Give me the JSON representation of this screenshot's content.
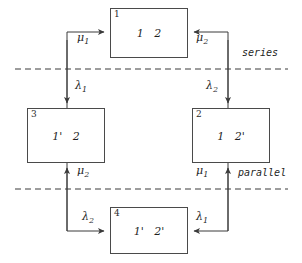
{
  "diagram": {
    "background_color": "#ffffff",
    "stroke_color": "#4a4a4a",
    "text_color": "#1f1f1f",
    "nodes": [
      {
        "key": "node-1",
        "id": "1",
        "contents": "1   2",
        "x": 110,
        "y": 8,
        "w": 78,
        "h": 50
      },
      {
        "key": "node-2",
        "id": "2",
        "contents": "1   2'",
        "x": 192,
        "y": 108,
        "w": 78,
        "h": 55
      },
      {
        "key": "node-3",
        "id": "3",
        "contents": "1'   2",
        "x": 27,
        "y": 108,
        "w": 78,
        "h": 55
      },
      {
        "key": "node-4",
        "id": "4",
        "contents": "1'   2'",
        "x": 110,
        "y": 207,
        "w": 78,
        "h": 47
      }
    ],
    "edge_labels": [
      {
        "key": "mu-1-top-left",
        "symbol": "μ",
        "sub": "1",
        "x": 77,
        "y": 32
      },
      {
        "key": "mu-2-top-right",
        "symbol": "μ",
        "sub": "2",
        "x": 196,
        "y": 32
      },
      {
        "key": "lambda-1-left",
        "symbol": "λ",
        "sub": "1",
        "x": 75,
        "y": 80
      },
      {
        "key": "lambda-2-right",
        "symbol": "λ",
        "sub": "2",
        "x": 206,
        "y": 80
      },
      {
        "key": "mu-2-bottom-left",
        "symbol": "μ",
        "sub": "2",
        "x": 77,
        "y": 165
      },
      {
        "key": "mu-1-bottom-right",
        "symbol": "μ",
        "sub": "1",
        "x": 196,
        "y": 165
      },
      {
        "key": "lambda-2-bottom",
        "symbol": "λ",
        "sub": "2",
        "x": 82,
        "y": 211
      },
      {
        "key": "lambda-1-bottom",
        "symbol": "λ",
        "sub": "1",
        "x": 196,
        "y": 211
      }
    ],
    "region_labels": [
      {
        "key": "series-label",
        "text": "series",
        "x": 242,
        "y": 47
      },
      {
        "key": "parallel-label",
        "text": "parallel",
        "x": 238,
        "y": 167
      }
    ],
    "divider_lines": [
      {
        "key": "series-divider",
        "y": 69,
        "x1": 15,
        "x2": 288
      },
      {
        "key": "parallel-divider",
        "y": 189,
        "x1": 15,
        "x2": 288
      }
    ]
  }
}
